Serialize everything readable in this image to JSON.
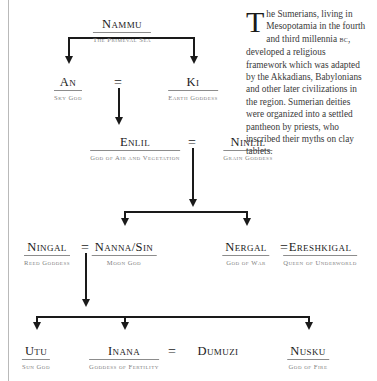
{
  "page": {
    "background_color": "#ffffff",
    "line_color": "#1a1a1a",
    "role_text_color": "#808080"
  },
  "sidebar_text": {
    "dropcap": "T",
    "body_part1": "he Sumerians, living in Mesopotamia in the fourth and third millennia ",
    "era": "bc",
    "body_part2": ", developed a religious framework which was adapted by the Akkadians, Babylonians and other later civilizations in the region. Sumerian deities were organized into a settled pantheon by priests, who inscribed their myths on clay tablets."
  },
  "marriage_symbol": "=",
  "nodes": [
    {
      "id": "nammu",
      "name": "Nammu",
      "role": "The Primeval Sea",
      "x": 122,
      "y": 18,
      "ruled": true
    },
    {
      "id": "an",
      "name": "An",
      "role": "Sky God",
      "x": 68,
      "y": 76,
      "ruled": true
    },
    {
      "id": "ki",
      "name": "Ki",
      "role": "Earth Goddess",
      "x": 193,
      "y": 76,
      "ruled": true
    },
    {
      "id": "enlil",
      "name": "Enlil",
      "role": "God of Air and Vegetation",
      "x": 135,
      "y": 136,
      "ruled": true
    },
    {
      "id": "ninlil",
      "name": "Ninlil",
      "role": "Grain Goddess",
      "x": 248,
      "y": 136,
      "ruled": true
    },
    {
      "id": "ningal",
      "name": "Ningal",
      "role": "Reed Goddess",
      "x": 47,
      "y": 241,
      "ruled": true
    },
    {
      "id": "nannasin",
      "name": "Nanna/Sin",
      "role": "Moon God",
      "x": 124,
      "y": 241,
      "ruled": true
    },
    {
      "id": "nergal",
      "name": "Nergal",
      "role": "God of War",
      "x": 246,
      "y": 241,
      "ruled": true
    },
    {
      "id": "ereshkigal",
      "name": "Ereshkigal",
      "role": "Queen of Underworld",
      "x": 320,
      "y": 241,
      "ruled": true
    },
    {
      "id": "utu",
      "name": "Utu",
      "role": "Sun God",
      "x": 36,
      "y": 345,
      "ruled": true
    },
    {
      "id": "inana",
      "name": "Inana",
      "role": "Goddess of Fertility",
      "x": 124,
      "y": 345,
      "ruled": true
    },
    {
      "id": "dumuzi",
      "name": "Dumuzi",
      "role": "",
      "x": 218,
      "y": 345,
      "ruled": false
    },
    {
      "id": "nusku",
      "name": "Nusku",
      "role": "God of Fire",
      "x": 308,
      "y": 345,
      "ruled": true
    }
  ],
  "unions": [
    {
      "id": "an-ki",
      "symbol": "=",
      "x": 118,
      "y": 78
    },
    {
      "id": "enlil-ninlil",
      "symbol": "=",
      "x": 192,
      "y": 138
    },
    {
      "id": "ningal-nannasin",
      "symbol": "=",
      "x": 85,
      "y": 243
    },
    {
      "id": "nergal-ereshkigal",
      "symbol": "=",
      "x": 284,
      "y": 243
    },
    {
      "id": "inana-dumuzi",
      "symbol": "=",
      "x": 172,
      "y": 347
    }
  ],
  "connectors": [
    {
      "id": "nammu-bar",
      "type": "horizontal",
      "x": 68,
      "y": 37,
      "length": 125
    },
    {
      "id": "nammu-to-an",
      "type": "vertical",
      "x": 68,
      "y": 37,
      "length": 22
    },
    {
      "id": "nammu-to-ki",
      "type": "vertical",
      "x": 193,
      "y": 37,
      "length": 22
    },
    {
      "id": "union-to-enlil",
      "type": "vertical",
      "x": 118,
      "y": 88,
      "length": 33
    },
    {
      "id": "union-to-children",
      "type": "vertical",
      "x": 192,
      "y": 148,
      "length": 55
    },
    {
      "id": "children-bar",
      "type": "horizontal",
      "x": 124,
      "y": 211,
      "length": 122
    },
    {
      "id": "bar-to-nannasin",
      "type": "vertical",
      "x": 124,
      "y": 211,
      "length": 11
    },
    {
      "id": "bar-to-nergal",
      "type": "vertical",
      "x": 246,
      "y": 211,
      "length": 11
    },
    {
      "id": "nanna-to-gen4",
      "type": "vertical",
      "x": 85,
      "y": 253,
      "length": 50
    },
    {
      "id": "gen4-bar",
      "type": "horizontal",
      "x": 36,
      "y": 316,
      "length": 272
    },
    {
      "id": "bar-to-utu",
      "type": "vertical",
      "x": 36,
      "y": 316,
      "length": 11
    },
    {
      "id": "bar-to-inana",
      "type": "vertical",
      "x": 124,
      "y": 316,
      "length": 11
    },
    {
      "id": "bar-to-nusku",
      "type": "vertical",
      "x": 308,
      "y": 316,
      "length": 11
    }
  ],
  "arrows": [
    {
      "id": "arrow-an",
      "x": 68,
      "y": 56
    },
    {
      "id": "arrow-ki",
      "x": 193,
      "y": 56
    },
    {
      "id": "arrow-enlil",
      "x": 118,
      "y": 117
    },
    {
      "id": "arrow-children",
      "x": 192,
      "y": 199
    },
    {
      "id": "arrow-nannasin",
      "x": 124,
      "y": 218
    },
    {
      "id": "arrow-nergal",
      "x": 246,
      "y": 218
    },
    {
      "id": "arrow-gen4",
      "x": 85,
      "y": 299
    },
    {
      "id": "arrow-utu",
      "x": 36,
      "y": 322
    },
    {
      "id": "arrow-inana",
      "x": 124,
      "y": 322
    },
    {
      "id": "arrow-nusku",
      "x": 308,
      "y": 322
    }
  ]
}
